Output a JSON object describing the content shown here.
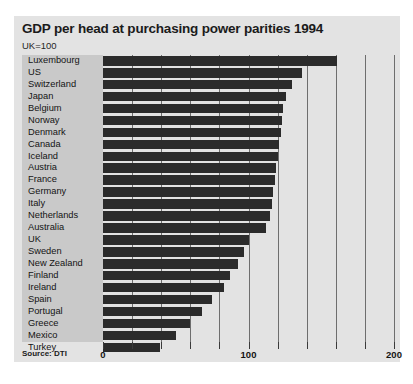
{
  "chart_data": {
    "type": "bar",
    "orientation": "horizontal",
    "title": "GDP per head at purchasing power parities 1994",
    "subtitle": "UK=100",
    "source": "Source: DTI",
    "xlabel": "",
    "ylabel": "",
    "xlim": [
      0,
      200
    ],
    "grid": true,
    "legend": null,
    "tick_interval": 20,
    "tick_values": [
      0,
      20,
      40,
      60,
      80,
      100,
      120,
      140,
      160,
      180,
      200
    ],
    "labeled_ticks": [
      {
        "value": 0,
        "label": "0"
      },
      {
        "value": 100,
        "label": "100"
      },
      {
        "value": 200,
        "label": "200"
      }
    ],
    "categories": [
      "Luxembourg",
      "US",
      "Switzerland",
      "Japan",
      "Belgium",
      "Norway",
      "Denmark",
      "Canada",
      "Iceland",
      "Austria",
      "France",
      "Germany",
      "Italy",
      "Netherlands",
      "Australia",
      "UK",
      "Sweden",
      "New Zealand",
      "Finland",
      "Ireland",
      "Spain",
      "Portugal",
      "Greece",
      "Mexico",
      "Turkey"
    ],
    "values": [
      161,
      137,
      130,
      126,
      124,
      123,
      122,
      121,
      120,
      119,
      118,
      117,
      116,
      115,
      112,
      100,
      97,
      93,
      87,
      83,
      75,
      68,
      60,
      50,
      39
    ],
    "bar_color": "#2b2b2b",
    "plot_background": "#e3e3e3",
    "label_panel_color": "#c9c9c9"
  }
}
